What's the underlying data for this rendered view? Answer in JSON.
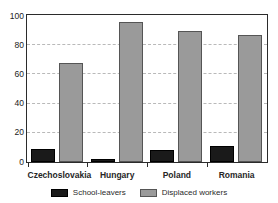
{
  "chart_data": {
    "type": "bar",
    "title": "",
    "xlabel": "",
    "ylabel": "",
    "ylim": [
      0,
      100
    ],
    "yticks": [
      0,
      20,
      40,
      60,
      80,
      100
    ],
    "grid": true,
    "legend_position": "bottom",
    "categories": [
      "Czechoslovakia",
      "Hungary",
      "Poland",
      "Romania"
    ],
    "series": [
      {
        "name": "School-leavers",
        "color": "#1a1a1a",
        "values": [
          9,
          2,
          8,
          11
        ]
      },
      {
        "name": "Displaced workers",
        "color": "#9a9a9a",
        "values": [
          68,
          96,
          90,
          87
        ]
      }
    ]
  },
  "axis": {
    "ytick_labels": [
      "100",
      "80",
      "60",
      "40",
      "20",
      "0"
    ]
  },
  "legend": {
    "items": [
      {
        "label": "School-leavers",
        "swatch": "dark-swatch-icon"
      },
      {
        "label": "Displaced workers",
        "swatch": "light-swatch-icon"
      }
    ]
  }
}
